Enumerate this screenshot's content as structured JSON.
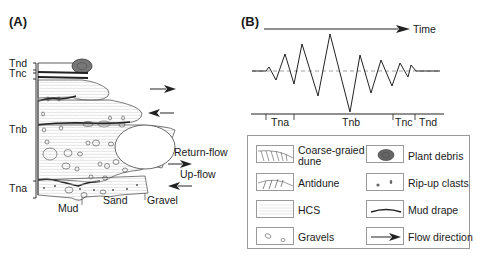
{
  "panel_a": {
    "label": "(A)",
    "units": [
      "Tnd",
      "Tnc",
      "Tnb",
      "Tna"
    ],
    "flow_labels": {
      "return_flow": "Return-flow",
      "up_flow": "Up-flow"
    },
    "grain_labels": [
      "Mud",
      "Sand",
      "Gravel"
    ]
  },
  "panel_b": {
    "label": "(B)",
    "time_label": "Time",
    "intervals": [
      "Tna",
      "Tnb",
      "Tnc",
      "Tnd"
    ]
  },
  "legend": {
    "items": [
      {
        "icon": "coarse-grained-dune-icon",
        "label": "Coarse-graied",
        "label2": "dune"
      },
      {
        "icon": "plant-debris-icon",
        "label": "Plant debris"
      },
      {
        "icon": "antidune-icon",
        "label": "Antidune"
      },
      {
        "icon": "rip-up-clasts-icon",
        "label": "Rip-up clasts"
      },
      {
        "icon": "hcs-icon",
        "label": "HCS"
      },
      {
        "icon": "mud-drape-icon",
        "label": "Mud drape"
      },
      {
        "icon": "gravels-icon",
        "label": "Gravels"
      },
      {
        "icon": "flow-direction-icon",
        "label": "Flow direction"
      }
    ]
  }
}
